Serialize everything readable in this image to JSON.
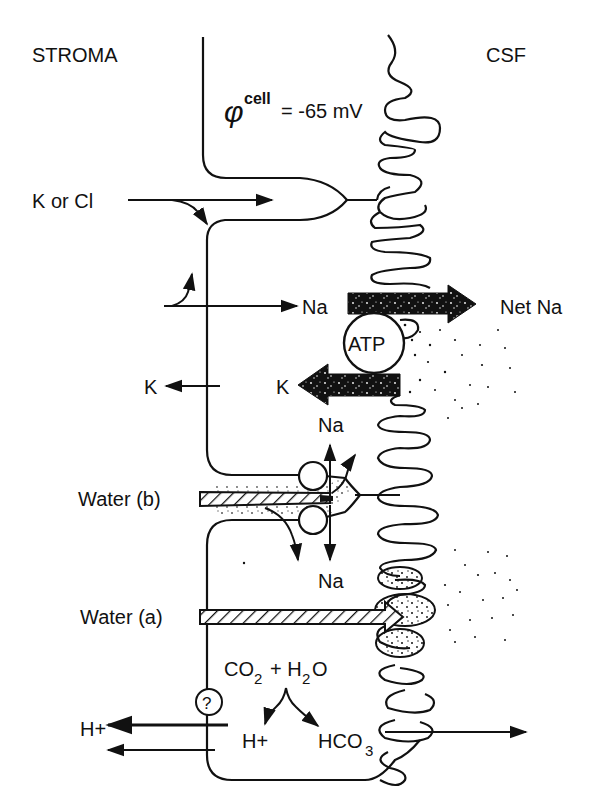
{
  "regions": {
    "left": "STROMA",
    "right": "CSF"
  },
  "potential": {
    "symbol": "φ",
    "superscript": "cell",
    "value": "= -65 mV"
  },
  "labels": {
    "k_or_cl": "K or Cl",
    "na_in": "Na",
    "net_na": "Net Na",
    "atp": "ATP",
    "k_left": "K",
    "k_pump": "K",
    "na_up": "Na",
    "na_down": "Na",
    "water_b": "Water (b)",
    "water_a": "Water (a)",
    "co2": "CO",
    "co2_sub": "2",
    "plus": "+ H",
    "h2o_sub": "2",
    "h2o_o": "O",
    "h_plus_left": "H+",
    "h_plus_cell": "H+",
    "hco3": "HCO",
    "hco3_sub": "3",
    "question": "?"
  },
  "colors": {
    "ink": "#111111",
    "background": "#ffffff"
  }
}
